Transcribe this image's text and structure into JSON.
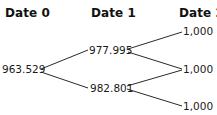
{
  "tree": {
    "headers": [
      "Date 0",
      "Date 1",
      "Date 2"
    ],
    "date0": {
      "value": "963.529"
    },
    "date1": {
      "up": "977.995",
      "down": "982.801"
    },
    "date2": {
      "uu": "1,000",
      "ud": "1,000",
      "dd": "1,000"
    }
  }
}
